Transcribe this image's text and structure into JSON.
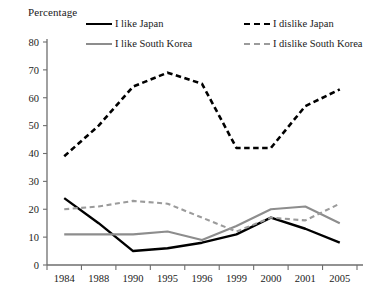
{
  "chart_data": {
    "type": "line",
    "title": "",
    "ylabel": "Percentage",
    "xlabel": "",
    "ylim": [
      0,
      80
    ],
    "yticks": [
      0,
      10,
      20,
      30,
      40,
      50,
      60,
      70,
      80
    ],
    "grid": false,
    "legend_position": "top",
    "categories": [
      "1984",
      "1988",
      "1990",
      "1995",
      "1996",
      "1999",
      "2000",
      "2001",
      "2005"
    ],
    "series": [
      {
        "name": "I like Japan",
        "color": "#000000",
        "style": "solid",
        "values": [
          24,
          15,
          5,
          6,
          8,
          11,
          17,
          13,
          8
        ]
      },
      {
        "name": "I dislike Japan",
        "color": "#000000",
        "style": "dashed",
        "values": [
          39,
          50,
          64,
          69,
          65,
          42,
          42,
          57,
          63
        ]
      },
      {
        "name": "I like South Korea",
        "color": "#8d8d8d",
        "style": "solid",
        "values": [
          11,
          11,
          11,
          12,
          9,
          14,
          20,
          21,
          15
        ]
      },
      {
        "name": "I dislike South Korea",
        "color": "#9b9b9b",
        "style": "dashed",
        "values": [
          20,
          21,
          23,
          22,
          17,
          12,
          17,
          16,
          22
        ]
      }
    ]
  },
  "axis": {
    "y_title": "Percentage"
  },
  "legend": {
    "items": [
      {
        "label": "I like Japan"
      },
      {
        "label": "I dislike Japan"
      },
      {
        "label": "I like South Korea"
      },
      {
        "label": "I dislike South Korea"
      }
    ]
  }
}
